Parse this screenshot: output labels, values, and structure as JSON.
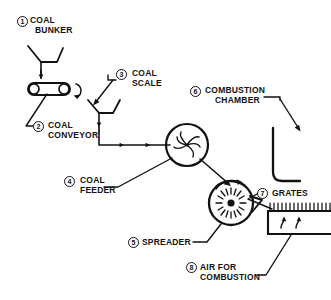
{
  "diagram": {
    "background_color": "#ffffff",
    "line_color": "#111111",
    "callouts": [
      {
        "number": "1",
        "label_line1": "COAL",
        "label_line2": "BUNKER",
        "component": "coal-bunker"
      },
      {
        "number": "2",
        "label_line1": "COAL",
        "label_line2": "CONVEYOR",
        "component": "coal-conveyor"
      },
      {
        "number": "3",
        "label_line1": "COAL",
        "label_line2": "SCALE",
        "component": "coal-scale"
      },
      {
        "number": "4",
        "label_line1": "COAL",
        "label_line2": "FEEDER",
        "component": "coal-feeder"
      },
      {
        "number": "5",
        "label_line1": "SPREADER",
        "label_line2": "",
        "component": "spreader"
      },
      {
        "number": "6",
        "label_line1": "COMBUSTION",
        "label_line2": "CHAMBER",
        "component": "combustion-chamber"
      },
      {
        "number": "7",
        "label_line1": "GRATES",
        "label_line2": "",
        "component": "grates"
      },
      {
        "number": "8",
        "label_line1": "AIR FOR",
        "label_line2": "COMBUSTION",
        "component": "air-for-combustion"
      }
    ]
  }
}
